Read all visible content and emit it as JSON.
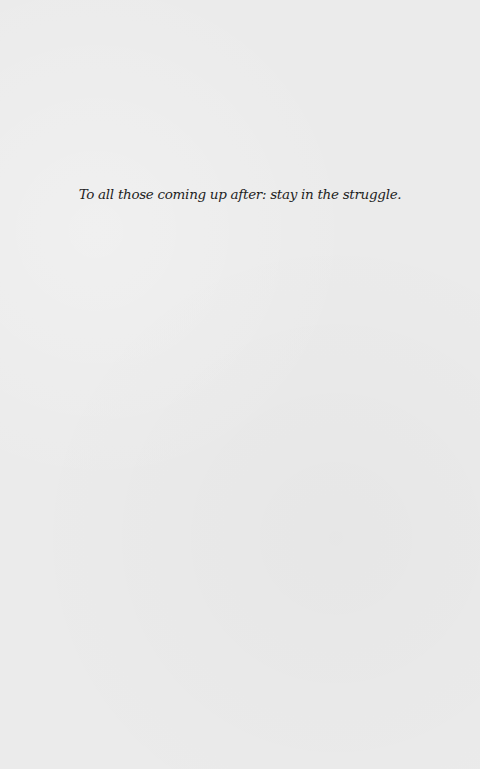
{
  "page": {
    "dedication": "To all those coming up after: stay in the struggle."
  }
}
